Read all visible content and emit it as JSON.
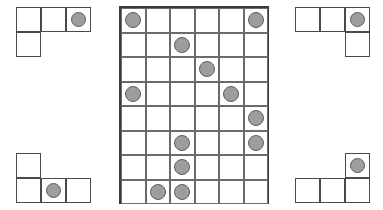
{
  "puzzle": {
    "type": "grid-and-pieces-puzzle",
    "colors": {
      "background": "#ffffff",
      "cell_fill": "#ffffff",
      "cell_border": "#4a4a4a",
      "grid_line": "#6b6b6b",
      "board_border": "#3a3a3a",
      "disc_fill": "#9d9d9d",
      "disc_border": "#5d5d5d"
    },
    "board": {
      "label": "main-board",
      "columns": 6,
      "rows": 8,
      "cell_size": 24.5,
      "discs": [
        {
          "row": 1,
          "col": 1
        },
        {
          "row": 1,
          "col": 6
        },
        {
          "row": 2,
          "col": 3
        },
        {
          "row": 3,
          "col": 4
        },
        {
          "row": 4,
          "col": 1
        },
        {
          "row": 4,
          "col": 5
        },
        {
          "row": 5,
          "col": 6
        },
        {
          "row": 6,
          "col": 3
        },
        {
          "row": 6,
          "col": 6
        },
        {
          "row": 7,
          "col": 3
        },
        {
          "row": 8,
          "col": 2
        },
        {
          "row": 8,
          "col": 3
        }
      ],
      "disc_count": 12
    },
    "pieces": [
      {
        "label": "top-left-piece",
        "position": "top-left",
        "shape": "L-shape",
        "cell_size": 25,
        "cells": [
          {
            "row": 1,
            "col": 1,
            "disc": false
          },
          {
            "row": 1,
            "col": 2,
            "disc": false
          },
          {
            "row": 1,
            "col": 3,
            "disc": true
          },
          {
            "row": 2,
            "col": 1,
            "disc": false
          }
        ],
        "cell_count": 4,
        "disc_count": 1
      },
      {
        "label": "top-right-piece",
        "position": "top-right",
        "shape": "J-shape",
        "cell_size": 25,
        "cells": [
          {
            "row": 1,
            "col": 1,
            "disc": false
          },
          {
            "row": 1,
            "col": 2,
            "disc": false
          },
          {
            "row": 1,
            "col": 3,
            "disc": true
          },
          {
            "row": 2,
            "col": 3,
            "disc": false
          }
        ],
        "cell_count": 4,
        "disc_count": 1
      },
      {
        "label": "bottom-left-piece",
        "position": "bottom-left",
        "shape": "J-shape",
        "cell_size": 25,
        "cells": [
          {
            "row": 1,
            "col": 1,
            "disc": false
          },
          {
            "row": 2,
            "col": 1,
            "disc": false
          },
          {
            "row": 2,
            "col": 2,
            "disc": true
          },
          {
            "row": 2,
            "col": 3,
            "disc": false
          }
        ],
        "cell_count": 4,
        "disc_count": 1
      },
      {
        "label": "bottom-right-piece",
        "position": "bottom-right",
        "shape": "L-shape",
        "cell_size": 25,
        "cells": [
          {
            "row": 1,
            "col": 3,
            "disc": true
          },
          {
            "row": 2,
            "col": 1,
            "disc": false
          },
          {
            "row": 2,
            "col": 2,
            "disc": false
          },
          {
            "row": 2,
            "col": 3,
            "disc": false
          }
        ],
        "cell_count": 4,
        "disc_count": 1
      }
    ]
  }
}
